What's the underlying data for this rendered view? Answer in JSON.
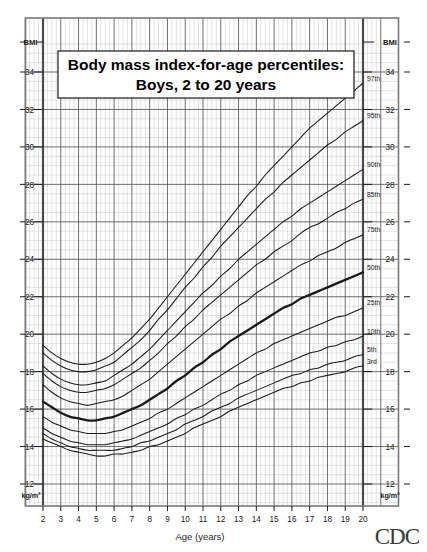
{
  "title": {
    "line1": "Body mass index-for-age percentiles:",
    "line2": "Boys, 2 to 20 years"
  },
  "axes": {
    "x_label": "Age (years)",
    "y_label_top_left": "BMI",
    "y_label_top_right": "BMI",
    "y_unit_left": "kg/m²",
    "y_unit_right": "kg/m²",
    "x_ticks": [
      2,
      3,
      4,
      5,
      6,
      7,
      8,
      9,
      10,
      11,
      12,
      13,
      14,
      15,
      16,
      17,
      18,
      19,
      20
    ],
    "y_ticks": [
      12,
      14,
      16,
      18,
      20,
      22,
      24,
      26,
      28,
      30,
      32,
      34
    ],
    "xlim": [
      1,
      21
    ],
    "ylim": [
      11,
      36
    ],
    "grid": true
  },
  "footer": {
    "logo_text": "CDC"
  },
  "colors": {
    "line": "#1a1a1a",
    "grid_major": "#555555",
    "grid_minor": "#bbbbbb",
    "frame": "#7a7a7a",
    "background": "#ffffff"
  },
  "chart_data": {
    "type": "line",
    "title": "Body mass index-for-age percentiles: Boys, 2 to 20 years",
    "xlabel": "Age (years)",
    "ylabel": "BMI",
    "yunit": "kg/m²",
    "xlim": [
      1,
      21
    ],
    "ylim": [
      11,
      36
    ],
    "grid": true,
    "legend_position": "inline-right-of-curve-ends",
    "x": [
      2,
      2.5,
      3,
      3.5,
      4,
      4.5,
      5,
      5.5,
      6,
      6.5,
      7,
      7.5,
      8,
      8.5,
      9,
      9.5,
      10,
      10.5,
      11,
      11.5,
      12,
      12.5,
      13,
      13.5,
      14,
      14.5,
      15,
      15.5,
      16,
      16.5,
      17,
      17.5,
      18,
      18.5,
      19,
      19.5,
      20
    ],
    "series": [
      {
        "name": "97th",
        "label": "97th",
        "emphasis": false,
        "values": [
          19.4,
          19.0,
          18.7,
          18.5,
          18.4,
          18.4,
          18.5,
          18.7,
          19.0,
          19.4,
          19.8,
          20.3,
          20.8,
          21.4,
          22.0,
          22.6,
          23.2,
          23.8,
          24.4,
          25.0,
          25.6,
          26.2,
          26.8,
          27.4,
          27.9,
          28.5,
          29.0,
          29.5,
          30.0,
          30.5,
          31.0,
          31.4,
          31.8,
          32.2,
          32.6,
          33.0,
          33.4
        ]
      },
      {
        "name": "95th",
        "label": "95th",
        "emphasis": false,
        "values": [
          19.0,
          18.6,
          18.3,
          18.1,
          18.0,
          18.0,
          18.1,
          18.3,
          18.5,
          18.9,
          19.3,
          19.7,
          20.2,
          20.8,
          21.3,
          21.9,
          22.5,
          23.0,
          23.6,
          24.1,
          24.7,
          25.2,
          25.7,
          26.2,
          26.7,
          27.2,
          27.6,
          28.1,
          28.5,
          28.9,
          29.3,
          29.7,
          30.1,
          30.4,
          30.8,
          31.1,
          31.4
        ]
      },
      {
        "name": "90th",
        "label": "90th",
        "emphasis": false,
        "values": [
          18.3,
          17.9,
          17.6,
          17.4,
          17.3,
          17.3,
          17.4,
          17.5,
          17.8,
          18.1,
          18.4,
          18.8,
          19.2,
          19.7,
          20.2,
          20.7,
          21.2,
          21.7,
          22.2,
          22.6,
          23.1,
          23.5,
          24.0,
          24.4,
          24.8,
          25.2,
          25.6,
          26.0,
          26.3,
          26.7,
          27.0,
          27.3,
          27.6,
          27.9,
          28.2,
          28.5,
          28.8
        ]
      },
      {
        "name": "85th",
        "label": "85th",
        "emphasis": false,
        "values": [
          17.9,
          17.5,
          17.2,
          17.0,
          16.9,
          16.9,
          17.0,
          17.1,
          17.3,
          17.6,
          17.9,
          18.2,
          18.6,
          19.0,
          19.5,
          19.9,
          20.4,
          20.8,
          21.3,
          21.7,
          22.1,
          22.5,
          22.9,
          23.3,
          23.7,
          24.0,
          24.4,
          24.7,
          25.0,
          25.4,
          25.7,
          25.9,
          26.2,
          26.5,
          26.7,
          27.0,
          27.2
        ]
      },
      {
        "name": "75th",
        "label": "75th",
        "emphasis": false,
        "values": [
          17.3,
          16.9,
          16.6,
          16.4,
          16.3,
          16.2,
          16.3,
          16.4,
          16.5,
          16.7,
          17.0,
          17.3,
          17.6,
          18.0,
          18.4,
          18.8,
          19.2,
          19.6,
          20.0,
          20.4,
          20.8,
          21.1,
          21.5,
          21.8,
          22.2,
          22.5,
          22.8,
          23.1,
          23.4,
          23.7,
          23.9,
          24.2,
          24.4,
          24.6,
          24.9,
          25.1,
          25.3
        ]
      },
      {
        "name": "50th",
        "label": "50th",
        "emphasis": true,
        "values": [
          16.4,
          16.1,
          15.8,
          15.6,
          15.5,
          15.4,
          15.4,
          15.5,
          15.6,
          15.8,
          16.0,
          16.2,
          16.5,
          16.8,
          17.1,
          17.5,
          17.8,
          18.2,
          18.5,
          18.9,
          19.2,
          19.6,
          19.9,
          20.2,
          20.5,
          20.8,
          21.1,
          21.4,
          21.6,
          21.9,
          22.1,
          22.3,
          22.5,
          22.7,
          22.9,
          23.1,
          23.3
        ]
      },
      {
        "name": "25th",
        "label": "25th",
        "emphasis": false,
        "values": [
          15.6,
          15.3,
          15.1,
          14.9,
          14.8,
          14.7,
          14.7,
          14.7,
          14.8,
          14.9,
          15.1,
          15.3,
          15.5,
          15.8,
          16.0,
          16.3,
          16.6,
          16.9,
          17.2,
          17.5,
          17.8,
          18.1,
          18.4,
          18.7,
          19.0,
          19.2,
          19.5,
          19.7,
          19.9,
          20.1,
          20.3,
          20.5,
          20.7,
          20.9,
          21.0,
          21.2,
          21.4
        ]
      },
      {
        "name": "10th",
        "label": "10th",
        "emphasis": false,
        "values": [
          15.0,
          14.7,
          14.5,
          14.3,
          14.2,
          14.1,
          14.1,
          14.1,
          14.2,
          14.3,
          14.4,
          14.6,
          14.8,
          15.0,
          15.2,
          15.5,
          15.7,
          16.0,
          16.2,
          16.5,
          16.8,
          17.0,
          17.3,
          17.5,
          17.8,
          18.0,
          18.2,
          18.4,
          18.6,
          18.8,
          19.0,
          19.1,
          19.3,
          19.4,
          19.6,
          19.7,
          19.9
        ]
      },
      {
        "name": "5th",
        "label": "5th",
        "emphasis": false,
        "values": [
          14.7,
          14.4,
          14.2,
          14.0,
          13.9,
          13.8,
          13.8,
          13.8,
          13.8,
          13.9,
          14.0,
          14.2,
          14.3,
          14.5,
          14.7,
          14.9,
          15.2,
          15.4,
          15.6,
          15.9,
          16.1,
          16.3,
          16.6,
          16.8,
          17.0,
          17.2,
          17.4,
          17.6,
          17.8,
          17.9,
          18.1,
          18.2,
          18.4,
          18.5,
          18.6,
          18.8,
          18.9
        ]
      },
      {
        "name": "3rd",
        "label": "3rd",
        "emphasis": false,
        "values": [
          14.4,
          14.2,
          14.0,
          13.8,
          13.7,
          13.6,
          13.5,
          13.5,
          13.6,
          13.6,
          13.7,
          13.8,
          14.0,
          14.1,
          14.3,
          14.5,
          14.7,
          15.0,
          15.2,
          15.4,
          15.6,
          15.9,
          16.1,
          16.3,
          16.5,
          16.7,
          16.9,
          17.1,
          17.2,
          17.4,
          17.5,
          17.7,
          17.8,
          17.9,
          18.0,
          18.2,
          18.3
        ]
      }
    ]
  }
}
